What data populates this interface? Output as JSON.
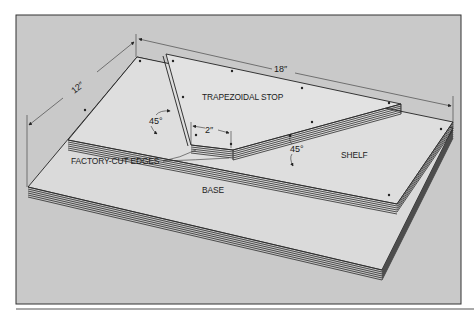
{
  "figure": {
    "colors": {
      "background": "#c9c9c9",
      "board_face": "#dcdcdc",
      "line": "#222222",
      "frame": "#333333"
    },
    "labels": {
      "trapezoidal_stop": "TRAPEZOIDAL STOP",
      "shelf": "SHELF",
      "base": "BASE",
      "factory_cut_edges": "FACTORY-CUT EDGES"
    },
    "dimensions": {
      "depth": "12″",
      "length": "18″",
      "gap": "2″",
      "angle_stop": "45°",
      "angle_shelf": "45°"
    }
  }
}
